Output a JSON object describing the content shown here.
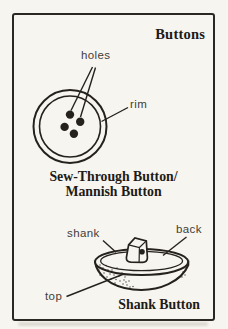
{
  "title": "Buttons",
  "sew_through": {
    "labels": {
      "holes": "holes",
      "rim": "rim"
    },
    "caption_line1": "Sew-Through Button/",
    "caption_line2": "Mannish Button"
  },
  "shank": {
    "labels": {
      "shank": "shank",
      "back": "back",
      "top": "top"
    },
    "caption": "Shank Button"
  },
  "colors": {
    "ink": "#25221d",
    "label_text": "#3f3d39",
    "paper": "#f7f5f0",
    "frame_border": "#2b2823"
  }
}
